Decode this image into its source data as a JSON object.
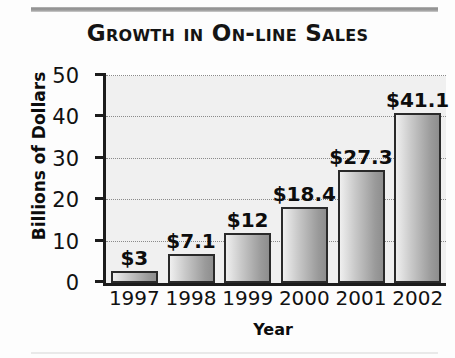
{
  "chart_data": {
    "type": "bar",
    "title": "Growth in On-line Sales",
    "xlabel": "Year",
    "ylabel": "Billions of Dollars",
    "categories": [
      "1997",
      "1998",
      "1999",
      "2000",
      "2001",
      "2002"
    ],
    "values": [
      3,
      7.1,
      12,
      18.4,
      27.3,
      41.1
    ],
    "data_labels": [
      "$3",
      "$7.1",
      "$12",
      "$18.4",
      "$27.3",
      "$41.1"
    ],
    "ylim": [
      0,
      50
    ],
    "yticks": [
      0,
      10,
      20,
      30,
      40,
      50
    ],
    "ytick_labels": [
      "0",
      "10",
      "20",
      "30",
      "40",
      "50"
    ],
    "grid": "horizontal-dotted",
    "legend": "none",
    "colors": {
      "bar_fill_light": "#efefef",
      "bar_fill_dark": "#8e8e8e",
      "bar_outline": "#2a2a2a",
      "axis": "#1c1c1c",
      "plot_background": "#f0f0f0",
      "gridline": "#8a8a8a",
      "text": "#0d0d0d",
      "rule": "#8d8d8d"
    }
  }
}
